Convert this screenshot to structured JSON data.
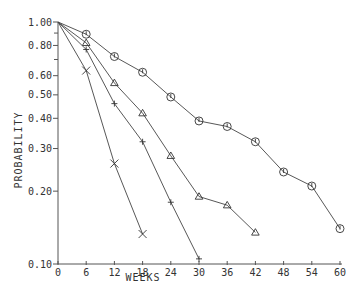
{
  "chart_data": {
    "type": "line",
    "title": "",
    "xlabel": "WEEKS",
    "ylabel": "PROBABILITY",
    "xscale": "linear",
    "yscale": "log",
    "xlim": [
      0,
      60
    ],
    "ylim": [
      0.1,
      1.0
    ],
    "grid": false,
    "legend": null,
    "x_ticks": [
      0,
      6,
      12,
      18,
      24,
      30,
      36,
      42,
      48,
      54,
      60
    ],
    "x_tick_labels": [
      "0",
      "6",
      "12",
      "18",
      "24",
      "30",
      "36",
      "42",
      "48",
      "54",
      "60"
    ],
    "y_ticks": [
      1.0,
      0.8,
      0.6,
      0.5,
      0.4,
      0.3,
      0.2,
      0.1
    ],
    "y_tick_labels": [
      "1.00",
      "0.80",
      "0.60",
      "0.50",
      "0.40",
      "0.30",
      "0.20",
      "0.10"
    ],
    "y_minor_ticks": [
      0.9,
      0.7
    ],
    "series": [
      {
        "name": "circle",
        "marker": "circle",
        "x": [
          0,
          6,
          12,
          18,
          24,
          30,
          36,
          42,
          48,
          54,
          60
        ],
        "values": [
          1.0,
          0.89,
          0.72,
          0.62,
          0.49,
          0.39,
          0.37,
          0.32,
          0.24,
          0.21,
          0.14
        ]
      },
      {
        "name": "triangle",
        "marker": "triangle",
        "x": [
          0,
          6,
          12,
          18,
          24,
          30,
          36,
          42
        ],
        "values": [
          1.0,
          0.82,
          0.56,
          0.42,
          0.28,
          0.19,
          0.175,
          0.135
        ]
      },
      {
        "name": "plus",
        "marker": "plus",
        "x": [
          0,
          6,
          12,
          18,
          24,
          30
        ],
        "values": [
          1.0,
          0.77,
          0.46,
          0.32,
          0.18,
          0.105
        ]
      },
      {
        "name": "cross",
        "marker": "x",
        "x": [
          0,
          6,
          12,
          18
        ],
        "values": [
          1.0,
          0.63,
          0.26,
          0.133
        ]
      }
    ]
  },
  "colors": {
    "axis": "#555555",
    "line": "#444444",
    "text": "#333333",
    "background": "#ffffff"
  }
}
